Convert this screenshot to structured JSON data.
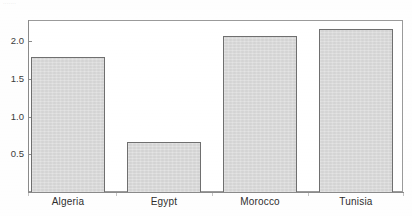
{
  "caption_fragment": "·······",
  "chart_data": {
    "type": "bar",
    "title": "",
    "subtitle": "",
    "xlabel": "",
    "ylabel": "",
    "categories": [
      "Algeria",
      "Egypt",
      "Morocco",
      "Tunisia"
    ],
    "values": [
      1.79,
      0.67,
      2.07,
      2.16
    ],
    "series": [
      {
        "name": "",
        "values": [
          1.79,
          0.67,
          2.07,
          2.16
        ]
      }
    ],
    "ylim": [
      0,
      2.3
    ],
    "yticks": [
      "0.5",
      "1.0",
      "1.5",
      "2.0"
    ],
    "ytick_values": [
      0.5,
      1.0,
      1.5,
      2.0
    ],
    "grid": false,
    "legend": null,
    "legend_position": "none",
    "annotations": [],
    "bar_fill_color": "#d9d9d9",
    "bar_border_color": "#6f6f6f",
    "axis_color": "#8a8a8a",
    "text_color": "#2e2e2e",
    "background_color": "#ffffff"
  },
  "axis": {
    "y_ticks": [
      {
        "label": "2.0",
        "value": 2.0
      },
      {
        "label": "1.5",
        "value": 1.5
      },
      {
        "label": "1.0",
        "value": 1.0
      },
      {
        "label": "0.5",
        "value": 0.5
      }
    ],
    "x_ticks": [
      {
        "label": "Algeria"
      },
      {
        "label": "Egypt"
      },
      {
        "label": "Morocco"
      },
      {
        "label": "Tunisia"
      }
    ]
  }
}
